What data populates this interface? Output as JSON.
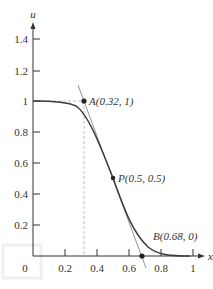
{
  "figure": {
    "axes": {
      "x_label": "x",
      "y_label": "u",
      "x_ticks": [
        "0",
        "0.2",
        "0.4",
        "0.6",
        "0.8",
        "1"
      ],
      "y_ticks": [
        "0.2",
        "0.4",
        "0.6",
        "0.8",
        "1",
        "1.2",
        "1.4"
      ]
    },
    "points": [
      {
        "name": "A",
        "label": "A(0.32, 1)",
        "x": 0.32,
        "y": 1
      },
      {
        "name": "P",
        "label": "P(0.5, 0.5)",
        "x": 0.5,
        "y": 0.5
      },
      {
        "name": "B",
        "label": "B(0.68, 0)",
        "x": 0.68,
        "y": 0
      }
    ],
    "colors": {
      "curve": "#3a3a3a",
      "tangent": "#777777",
      "dashed": "#aaaaaa"
    }
  }
}
